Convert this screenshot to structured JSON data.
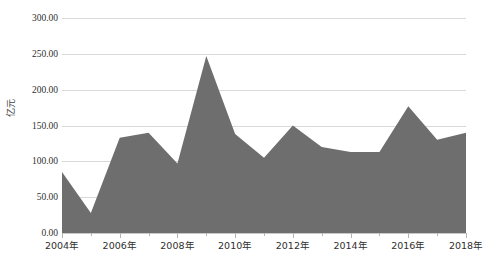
{
  "chart_data": {
    "type": "area",
    "title": "",
    "subtitle": "",
    "xlabel": "",
    "ylabel": "亿元",
    "ylim": [
      0,
      300
    ],
    "ytick_step": 50,
    "grid": true,
    "legend": "none",
    "series_color": "#6e6e6e",
    "gridline_color": "#d9d9d9",
    "axis_text_color": "#2f2f2f",
    "x": [
      2004,
      2005,
      2006,
      2007,
      2008,
      2009,
      2010,
      2011,
      2012,
      2013,
      2014,
      2015,
      2016,
      2017,
      2018
    ],
    "categories": [
      "2004年",
      "2005年",
      "2006年",
      "2007年",
      "2008年",
      "2009年",
      "2010年",
      "2011年",
      "2012年",
      "2013年",
      "2014年",
      "2015年",
      "2016年",
      "2017年",
      "2018年"
    ],
    "values": [
      85,
      28,
      133,
      140,
      97,
      247,
      138,
      105,
      150,
      120,
      113,
      113,
      177,
      130,
      140
    ],
    "ytick_labels": [
      "300.00",
      "250.00",
      "200.00",
      "150.00",
      "100.00",
      "50.00",
      "0.00"
    ],
    "ytick_values": [
      300,
      250,
      200,
      150,
      100,
      50,
      0
    ],
    "xtick_labels": [
      "2004年",
      "2006年",
      "2008年",
      "2010年",
      "2012年",
      "2014年",
      "2016年",
      "2018年"
    ],
    "xtick_values": [
      2004,
      2006,
      2008,
      2010,
      2012,
      2014,
      2016,
      2018
    ]
  }
}
